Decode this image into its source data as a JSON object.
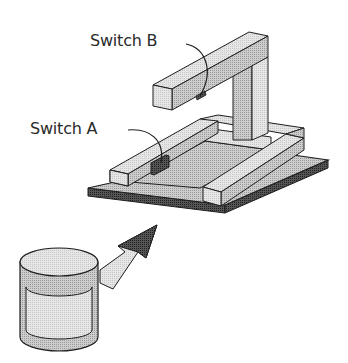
{
  "diagram": {
    "type": "isometric apparatus illustration",
    "labels": {
      "switch_b": "Switch B",
      "switch_a": "Switch A"
    },
    "components": [
      {
        "id": "base-plate",
        "description": "flat rectangular base plate"
      },
      {
        "id": "u-frame",
        "description": "U-shaped rectangular channel frame on base"
      },
      {
        "id": "vertical-pillar",
        "description": "vertical post at back right"
      },
      {
        "id": "top-arm",
        "description": "horizontal overhead arm extending from pillar"
      },
      {
        "id": "switch-a",
        "description": "dark switch block on inner side of left frame arm"
      },
      {
        "id": "switch-b",
        "description": "dark switch on underside of top arm"
      },
      {
        "id": "cylinder",
        "description": "cylindrical container in foreground"
      },
      {
        "id": "arrow",
        "description": "arrow from cylinder pointing under base plate"
      }
    ],
    "colors": {
      "outline": "#1e1e1e",
      "light_face": "#e2e2e2",
      "mid_face": "#c4c4c4",
      "dark_face": "#8e8e8e",
      "switch": "#3a3a3a",
      "plate_edge": "#5a5a5a"
    }
  }
}
